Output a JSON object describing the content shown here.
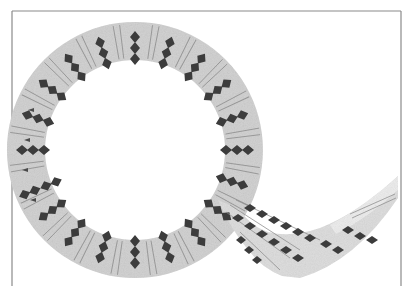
{
  "image": {
    "description": "Scanned photograph of a curved decorated band (ring shape with a trailing tail) bearing radial stripe lines and chains of dark diamond/lozenge motifs, within a thin grey rectangular frame",
    "colors": {
      "background": "#ffffff",
      "frame": "#8a8a8a",
      "band": "#cfcfcf",
      "band_light": "#e2e2e2",
      "stripe": "#8c8c8c",
      "diamond": "#3c3c3c"
    },
    "ring": {
      "cx": 135,
      "cy": 150,
      "r_outer": 128,
      "r_inner": 90
    },
    "diamond_chains": 24
  }
}
